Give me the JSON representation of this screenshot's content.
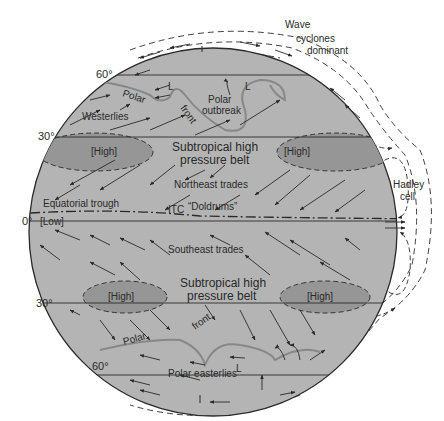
{
  "colors": {
    "globe_fill": "#b4b4b4",
    "high_fill": "#969696",
    "line": "#2a2a2a",
    "front": "#888888",
    "background": "#ffffff"
  },
  "latitude_labels": {
    "n60": "60°",
    "n30": "30°",
    "eq": "0°",
    "s30": "30°",
    "s60": "60°"
  },
  "labels": {
    "wave_cyclones_1": "Wave",
    "wave_cyclones_2": "cyclones",
    "wave_cyclones_3": "dominant",
    "polar_n": "Polar",
    "front_n": "front",
    "polar_outbreak_1": "Polar",
    "polar_outbreak_2": "outbreak",
    "low_l_1": "L",
    "low_l_2": "L",
    "westerlies": "Westerlies",
    "high_nw": "[High]",
    "high_ne": "[High]",
    "subtropical_n_1": "Subtropical high",
    "subtropical_n_2": "pressure belt",
    "ne_trades": "Northeast trades",
    "equatorial_trough": "Equatorial trough",
    "low_eq": "[Low]",
    "itc": "ITC",
    "doldrums": "“Doldrums”",
    "hadley_1": "Hadley",
    "hadley_2": "cell",
    "se_trades": "Southeast trades",
    "high_sw": "[High]",
    "high_se": "[High]",
    "subtropical_s_1": "Subtropical high",
    "subtropical_s_2": "pressure belt",
    "polar_s": "Polar",
    "front_s": "front",
    "low_l_s": "L",
    "polar_easterlies": "Polar easterlies"
  }
}
